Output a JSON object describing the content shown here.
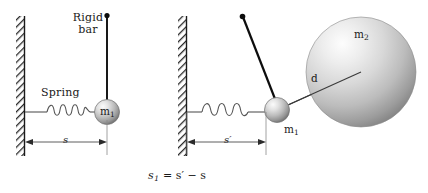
{
  "figure": {
    "equation_text": "s",
    "equation_sub": "1",
    "equation_rest": " = s′ − s"
  },
  "panel_left": {
    "name": "undisturbed configuration",
    "wall_label": "wall-hatched",
    "rigid_bar_label_line1": "Rigid",
    "rigid_bar_label_line2": "bar",
    "spring_label": "Spring",
    "mass_label": "m",
    "mass_sub": "1",
    "dimension_label": "s"
  },
  "panel_right": {
    "name": "deflected configuration with attracting mass",
    "wall_label": "wall-hatched",
    "mass1_label": "m",
    "mass1_sub": "1",
    "mass2_label": "m",
    "mass2_sub": "2",
    "distance_label": "d",
    "dimension_label": "s′"
  },
  "colors": {
    "ink": "#1a1a1a",
    "line": "#555555",
    "bar": "#0d0d0d",
    "sphere_light": "#f2f2f2",
    "sphere_mid": "#bdbdbd",
    "sphere_dark": "#6e6e6e",
    "wall_hatch": "#2b2b2b"
  }
}
